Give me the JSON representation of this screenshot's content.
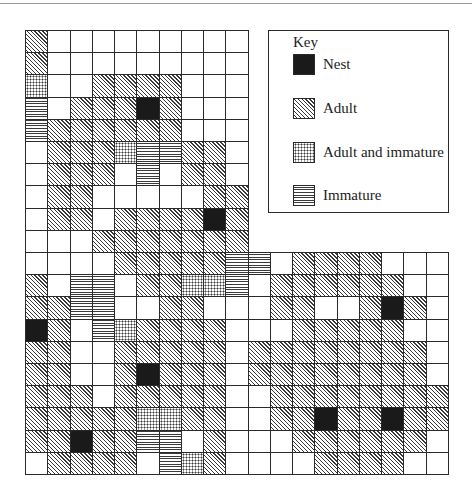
{
  "figure": {
    "type": "grid-map",
    "cell_size_px": 22.2,
    "upper_columns": 10,
    "lower_columns": 19,
    "upper_rows": 10,
    "lower_rows": 10,
    "legend_codes": {
      "N": "Nest",
      "A": "Adult",
      "AI": "Adult and immature",
      "I": "Immature",
      ".": "Empty"
    },
    "rows": [
      [
        "A",
        ".",
        ".",
        ".",
        ".",
        ".",
        ".",
        ".",
        ".",
        "."
      ],
      [
        "A",
        ".",
        ".",
        ".",
        ".",
        ".",
        ".",
        ".",
        ".",
        "."
      ],
      [
        "AI",
        ".",
        ".",
        "A",
        "A",
        "A",
        "A",
        ".",
        ".",
        "."
      ],
      [
        "I",
        ".",
        "A",
        "A",
        "A",
        "N",
        "A",
        ".",
        ".",
        "."
      ],
      [
        "I",
        "A",
        "A",
        "A",
        "A",
        "A",
        "A",
        ".",
        ".",
        "."
      ],
      [
        ".",
        "A",
        "A",
        "A",
        "AI",
        "I",
        "I",
        "A",
        "A",
        "."
      ],
      [
        ".",
        "A",
        "A",
        "A",
        ".",
        "I",
        ".",
        "A",
        "A",
        "."
      ],
      [
        ".",
        "A",
        "A",
        ".",
        ".",
        ".",
        ".",
        ".",
        "A",
        "A"
      ],
      [
        ".",
        "A",
        "A",
        ".",
        "A",
        "A",
        "A",
        "A",
        "N",
        "A"
      ],
      [
        ".",
        ".",
        ".",
        "A",
        "A",
        "A",
        "A",
        "A",
        "A",
        "A"
      ],
      [
        ".",
        ".",
        ".",
        ".",
        "A",
        "A",
        "A",
        "A",
        "A",
        "I",
        "I",
        ".",
        "A",
        "A",
        "A",
        "A",
        ".",
        ".",
        "."
      ],
      [
        "A",
        ".",
        "I",
        "I",
        ".",
        "A",
        "A",
        "AI",
        "AI",
        "I",
        ".",
        "A",
        "A",
        "A",
        "A",
        "A",
        "A",
        ".",
        "."
      ],
      [
        "A",
        "A",
        "I",
        "I",
        ".",
        ".",
        "A",
        "A",
        ".",
        ".",
        ".",
        "A",
        "A",
        ".",
        ".",
        "A",
        "N",
        "A",
        "."
      ],
      [
        "N",
        "A",
        ".",
        "I",
        "AI",
        "A",
        "A",
        "A",
        "A",
        ".",
        ".",
        ".",
        "A",
        "A",
        "A",
        "A",
        "A",
        ".",
        "."
      ],
      [
        "A",
        "A",
        ".",
        ".",
        "A",
        "A",
        "A",
        "A",
        "A",
        ".",
        "A",
        "A",
        "A",
        "A",
        "A",
        "A",
        "A",
        "A",
        "."
      ],
      [
        "A",
        "A",
        ".",
        ".",
        "A",
        "N",
        "A",
        "A",
        "A",
        ".",
        "A",
        "A",
        "A",
        "A",
        "A",
        "A",
        "A",
        "A",
        "."
      ],
      [
        "A",
        "A",
        "A",
        ".",
        "A",
        "A",
        "A",
        "A",
        "A",
        ".",
        ".",
        "A",
        "A",
        "A",
        "A",
        "A",
        "A",
        "A",
        "A"
      ],
      [
        "A",
        "A",
        "A",
        "A",
        "A",
        "AI",
        "AI",
        "A",
        "A",
        ".",
        ".",
        "A",
        "A",
        "N",
        "A",
        "A",
        "N",
        "A",
        "A"
      ],
      [
        "A",
        "A",
        "N",
        "A",
        "A",
        "I",
        "I",
        ".",
        "A",
        ".",
        ".",
        ".",
        "A",
        "A",
        "A",
        "A",
        "A",
        "A",
        "."
      ],
      [
        ".",
        "A",
        "A",
        "A",
        "A",
        ".",
        "I",
        "AI",
        "A",
        ".",
        ".",
        ".",
        ".",
        "A",
        "A",
        "A",
        "A",
        ".",
        "."
      ]
    ]
  },
  "key": {
    "title": "Key",
    "items": [
      {
        "code": "N",
        "label": "Nest",
        "icon": "solid-black-swatch"
      },
      {
        "code": "A",
        "label": "Adult",
        "icon": "diagonal-hatch-swatch"
      },
      {
        "code": "AI",
        "label": "Adult and immature",
        "icon": "dotted-swatch"
      },
      {
        "code": "I",
        "label": "Immature",
        "icon": "horizontal-lines-swatch"
      }
    ]
  },
  "colors": {
    "ink": "#1a1a1a",
    "line": "#2a2a2a",
    "paper": "#ffffff"
  }
}
